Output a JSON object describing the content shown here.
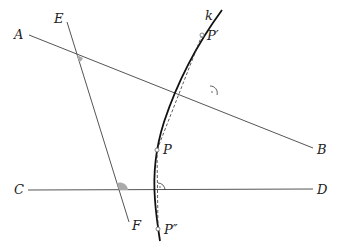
{
  "diagram": {
    "labels": {
      "A": "A",
      "B": "B",
      "C": "C",
      "D": "D",
      "E": "E",
      "F": "F",
      "k": "k",
      "P": "P",
      "P_prime": "P′",
      "P_double_prime": "P″"
    },
    "lines": [
      {
        "name": "AB",
        "from": "A",
        "to": "B"
      },
      {
        "name": "CD",
        "from": "C",
        "to": "D"
      },
      {
        "name": "EF",
        "from": "E",
        "to": "F"
      }
    ],
    "curve": {
      "name": "k",
      "points": [
        "P′",
        "P",
        "P″"
      ]
    },
    "dashed_segments": [
      [
        "P′",
        "P"
      ],
      [
        "P",
        "P″"
      ]
    ],
    "marked_angles": [
      {
        "at": "AB ∩ EF",
        "style": "filled-gray"
      },
      {
        "at": "CD ∩ EF",
        "style": "filled-gray"
      },
      {
        "at": "AB ∩ PP′",
        "style": "right-angle-arc"
      },
      {
        "at": "CD ∩ PP″",
        "style": "right-angle-arc"
      }
    ]
  }
}
